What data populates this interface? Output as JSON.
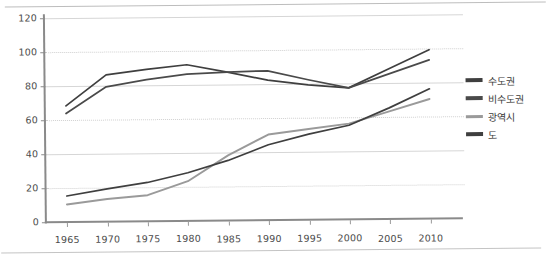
{
  "chart_data": {
    "type": "line",
    "title": "",
    "xlabel": "",
    "ylabel": "",
    "categories": [
      "1965",
      "1970",
      "1975",
      "1980",
      "1985",
      "1990",
      "1995",
      "2000",
      "2005",
      "2010"
    ],
    "ylim": [
      0,
      120
    ],
    "ytick_labels": [
      "0",
      "20",
      "40",
      "60",
      "80",
      "100",
      "120"
    ],
    "ytick_values": [
      0,
      20,
      40,
      60,
      80,
      100,
      120
    ],
    "grid": true,
    "legend_position": "right",
    "series": [
      {
        "name": "수도권",
        "color": "#3f3f3f",
        "values": [
          68,
          86,
          89,
          91.5,
          87,
          82,
          79,
          77,
          88,
          99
        ]
      },
      {
        "name": "비수도권",
        "color": "#4a4a4a",
        "values": [
          63.5,
          79,
          83,
          86,
          87,
          87.5,
          82,
          77,
          85,
          93
        ]
      },
      {
        "name": "광역시",
        "color": "#9a9a9a",
        "values": [
          10,
          13,
          15,
          23,
          38,
          50,
          53,
          56,
          63,
          70
        ]
      },
      {
        "name": "도",
        "color": "#3f3f3f",
        "values": [
          15,
          19,
          22.5,
          28,
          35,
          44,
          50,
          55,
          65,
          76
        ]
      }
    ]
  },
  "legend": {
    "items": [
      {
        "label": "수도권",
        "color": "#3f3f3f"
      },
      {
        "label": "비수도권",
        "color": "#4a4a4a"
      },
      {
        "label": "광역시",
        "color": "#9a9a9a"
      },
      {
        "label": "도",
        "color": "#3f3f3f"
      }
    ]
  }
}
